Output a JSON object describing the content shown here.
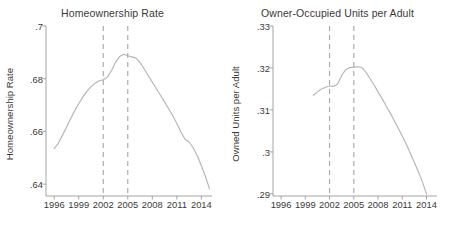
{
  "figure": {
    "width": 450,
    "height": 228,
    "background": "#ffffff",
    "line_color": "#b5b5b5",
    "axis_color": "#9a9a9a",
    "text_color": "#3a3a3a",
    "vline_color": "#a8a8a8"
  },
  "chart_data": [
    {
      "type": "line",
      "panel": "left",
      "title": "Homeownership Rate",
      "xlabel": "",
      "ylabel": "Homeownership Rate",
      "xlim": [
        1995.0,
        2015.3
      ],
      "ylim": [
        0.6355,
        0.7
      ],
      "xticks": [
        1996,
        1999,
        2002,
        2005,
        2008,
        2011,
        2014
      ],
      "xtick_labels": [
        "1996",
        "1999",
        "2002",
        "2005",
        "2008",
        "2011",
        "2014"
      ],
      "yticks": [
        0.64,
        0.66,
        0.68,
        0.7
      ],
      "ytick_labels": [
        ".64",
        ".66",
        ".68",
        ".7"
      ],
      "grid": false,
      "legend": "none",
      "vlines": [
        2002,
        2005
      ],
      "vline_style": "dashed",
      "series": [
        {
          "name": "Homeownership Rate",
          "x": [
            1996.0,
            1996.5,
            1997.0,
            1997.5,
            1998.0,
            1998.5,
            1999.0,
            1999.5,
            2000.0,
            2000.5,
            2001.0,
            2001.5,
            2002.0,
            2002.5,
            2003.0,
            2003.5,
            2004.0,
            2004.5,
            2005.0,
            2005.5,
            2006.0,
            2006.5,
            2007.0,
            2007.5,
            2008.0,
            2008.5,
            2009.0,
            2009.5,
            2010.0,
            2010.5,
            2011.0,
            2011.5,
            2012.0,
            2012.5,
            2013.0,
            2013.5,
            2014.0,
            2014.5,
            2015.0
          ],
          "y": [
            0.6535,
            0.6555,
            0.6585,
            0.6615,
            0.6648,
            0.6678,
            0.6705,
            0.673,
            0.6752,
            0.677,
            0.6783,
            0.6792,
            0.6796,
            0.6806,
            0.683,
            0.6862,
            0.6884,
            0.6893,
            0.6887,
            0.6883,
            0.6878,
            0.6862,
            0.6838,
            0.6812,
            0.6787,
            0.6762,
            0.6737,
            0.6712,
            0.6686,
            0.666,
            0.663,
            0.6598,
            0.657,
            0.656,
            0.6538,
            0.6508,
            0.647,
            0.6428,
            0.6382
          ]
        }
      ]
    },
    {
      "type": "line",
      "panel": "right",
      "title": "Owner-Occupied Units per Adult",
      "xlabel": "",
      "ylabel": "Owned Units per Adult",
      "xlim": [
        1995.0,
        2015.3
      ],
      "ylim": [
        0.2895,
        0.33
      ],
      "xticks": [
        1996,
        1999,
        2002,
        2005,
        2008,
        2011,
        2014
      ],
      "xtick_labels": [
        "1996",
        "1999",
        "2002",
        "2005",
        "2008",
        "2011",
        "2014"
      ],
      "yticks": [
        0.29,
        0.3,
        0.31,
        0.32,
        0.33
      ],
      "ytick_labels": [
        ".29",
        ".3",
        ".31",
        ".32",
        ".33"
      ],
      "grid": false,
      "legend": "none",
      "vlines": [
        2002,
        2005
      ],
      "vline_style": "dashed",
      "series": [
        {
          "name": "Owned Units per Adult",
          "x": [
            2000.0,
            2000.5,
            2001.0,
            2001.5,
            2002.0,
            2002.5,
            2003.0,
            2003.5,
            2004.0,
            2004.5,
            2005.0,
            2005.5,
            2006.0,
            2006.5,
            2007.0,
            2007.5,
            2008.0,
            2008.5,
            2009.0,
            2009.5,
            2010.0,
            2010.5,
            2011.0,
            2011.5,
            2012.0,
            2012.5,
            2013.0,
            2013.5,
            2014.0
          ],
          "y": [
            0.3135,
            0.3143,
            0.315,
            0.3154,
            0.3157,
            0.3156,
            0.3162,
            0.3182,
            0.3196,
            0.3201,
            0.3202,
            0.3203,
            0.3201,
            0.319,
            0.3175,
            0.316,
            0.3143,
            0.3127,
            0.311,
            0.3093,
            0.3075,
            0.3057,
            0.3038,
            0.3018,
            0.2997,
            0.2975,
            0.2953,
            0.2928,
            0.29
          ]
        }
      ]
    }
  ]
}
